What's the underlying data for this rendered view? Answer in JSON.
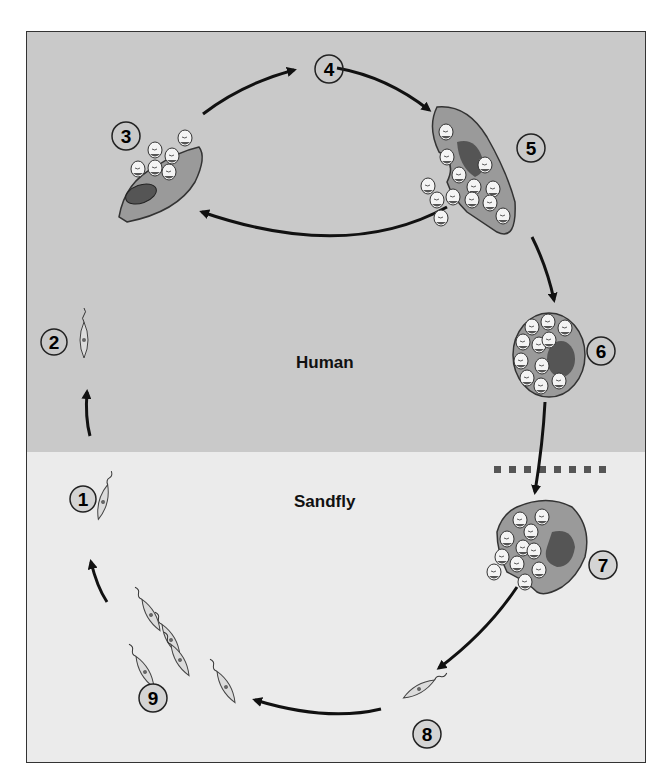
{
  "diagram": {
    "colors": {
      "human_bg": "#c9c9c9",
      "sandfly_bg": "#ebebeb",
      "cell_fill": "#9a9a9a",
      "nucleus_fill": "#555555",
      "arrow": "#111111",
      "frame": "#333333",
      "divider": "#555555"
    },
    "regions": [
      {
        "id": "human",
        "label": "Human"
      },
      {
        "id": "sandfly",
        "label": "Sandfly"
      }
    ],
    "stages": [
      {
        "number": "1",
        "desc": "Promastigote in sandfly",
        "region": "sandfly"
      },
      {
        "number": "2",
        "desc": "Promastigote injected into human",
        "region": "human"
      },
      {
        "number": "3",
        "desc": "Macrophage with amastigotes",
        "region": "human"
      },
      {
        "number": "4",
        "desc": "Amastigotes multiply",
        "region": "human"
      },
      {
        "number": "5",
        "desc": "Macrophage ruptures releasing amastigotes",
        "region": "human"
      },
      {
        "number": "6",
        "desc": "Infected macrophage ingested",
        "region": "human"
      },
      {
        "number": "7",
        "desc": "Macrophage in sandfly releases amastigotes",
        "region": "sandfly"
      },
      {
        "number": "8",
        "desc": "Amastigote transforms to promastigote",
        "region": "sandfly"
      },
      {
        "number": "9",
        "desc": "Promastigotes multiply",
        "region": "sandfly"
      }
    ]
  }
}
